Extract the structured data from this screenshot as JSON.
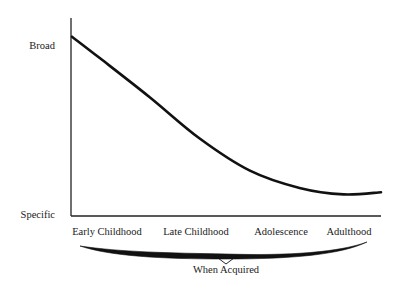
{
  "chart_data": {
    "type": "line",
    "title": "",
    "xlabel": "When Acquired",
    "ylabel": "",
    "y_tick_labels": [
      {
        "label": "Broad",
        "value": 0.83
      },
      {
        "label": "Specific",
        "value": 0.0
      }
    ],
    "x_tick_labels": [
      "Early Childhood",
      "Late Childhood",
      "Adolescence",
      "Adulthood"
    ],
    "xlim": [
      0,
      3.3
    ],
    "ylim": [
      0,
      1
    ],
    "grid": false,
    "legend": "none",
    "series": [
      {
        "name": "breadth",
        "x": [
          0.0,
          0.3,
          0.83,
          1.36,
          1.9,
          2.43,
          2.9,
          3.3
        ],
        "y": [
          0.83,
          0.73,
          0.55,
          0.36,
          0.21,
          0.13,
          0.1,
          0.11
        ]
      }
    ],
    "brace_span": [
      "Early Childhood",
      "Adulthood"
    ]
  }
}
